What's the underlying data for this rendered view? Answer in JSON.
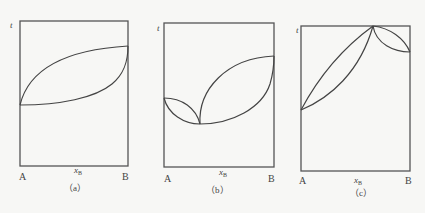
{
  "figure": {
    "panels": [
      {
        "id": "a",
        "caption": "（a）",
        "y_axis_label": "t",
        "x_axis_label": "x",
        "x_axis_sub": "B",
        "left_label": "A",
        "right_label": "B",
        "description": "Ideal binary system: lens-shaped boiling/dew curves from pure A (lower bp) to pure B (higher bp)"
      },
      {
        "id": "b",
        "caption": "（b）",
        "y_axis_label": "t",
        "x_axis_label": "x",
        "x_axis_sub": "B",
        "left_label": "A",
        "right_label": "B",
        "description": "Minimum-boiling azeotrope: two lenses meeting at a minimum point"
      },
      {
        "id": "c",
        "caption": "（c）",
        "y_axis_label": "t",
        "x_axis_label": "x",
        "x_axis_sub": "B",
        "left_label": "A",
        "right_label": "B",
        "description": "Maximum-boiling azeotrope: two lenses meeting at a maximum point"
      }
    ]
  }
}
